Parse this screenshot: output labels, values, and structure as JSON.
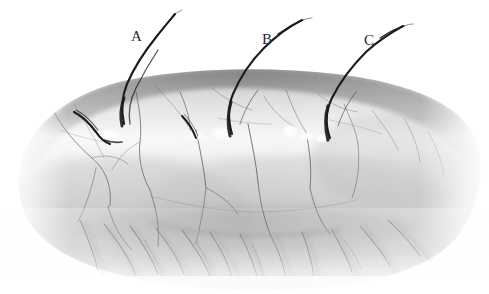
{
  "figure": {
    "domain": "scientific-illustration",
    "background_color": "#ffffff",
    "width": 489,
    "height": 294,
    "ink_color": "#1c1c1c",
    "skin_mid_tone": "#c9c9c9",
    "skin_light_tone": "#eaeaea",
    "skin_dark_tone": "#9a9a9a"
  },
  "labels": [
    {
      "id": "A",
      "text": "A",
      "x": 131,
      "y": 29,
      "leader_to_hair": "hair-a"
    },
    {
      "id": "B",
      "text": "B",
      "x": 262,
      "y": 32,
      "leader_to_hair": "hair-b"
    },
    {
      "id": "C",
      "text": "C",
      "x": 364,
      "y": 33,
      "leader_to_hair": "hair-c"
    }
  ],
  "hairs": [
    {
      "id": "hair-a",
      "label": "A",
      "emerges_at_x": 126,
      "emerges_at_y": 118,
      "tip_x": 174,
      "tip_y": 14,
      "description": "long dark S-curved hair, thick at base, tapering tip"
    },
    {
      "id": "hair-b",
      "label": "B",
      "emerges_at_x": 235,
      "emerges_at_y": 131,
      "tip_x": 301,
      "tip_y": 21,
      "description": "long dark S-curved hair emerging from skin with white highlight at base"
    },
    {
      "id": "hair-c",
      "label": "C",
      "emerges_at_x": 331,
      "emerges_at_y": 136,
      "tip_x": 402,
      "tip_y": 27,
      "description": "long dark S-curved hair emerging from skin on the right"
    }
  ],
  "hair_stubs": [
    {
      "id": "stub-left",
      "x": 80,
      "y": 115,
      "description": "short curved broken hair stub at left"
    },
    {
      "id": "stub-mid",
      "x": 186,
      "y": 122,
      "description": "short curved broken hair stub at center"
    }
  ],
  "highlights": [
    {
      "id": "highlight-b",
      "x": 222,
      "y": 133,
      "r": 7
    },
    {
      "id": "highlight-c1",
      "x": 290,
      "y": 131,
      "r": 6
    },
    {
      "id": "highlight-c2",
      "x": 306,
      "y": 135,
      "r": 5
    },
    {
      "id": "highlight-c3",
      "x": 320,
      "y": 137,
      "r": 5
    }
  ],
  "skin_surface": {
    "id": "skin-body",
    "top_arc_left_x": 22,
    "top_arc_peak_x": 230,
    "top_arc_peak_y": 76,
    "top_arc_right_x": 478,
    "bottom_fade_y": 285,
    "description": "arched skin slab, dark rim along top edge, lighter band beneath, soft fibrous fade at bottom"
  },
  "veins": {
    "count": 26,
    "color": "#4a4a4a",
    "description": "thin branching capillary lines descending across the skin"
  },
  "fibers": {
    "count": 22,
    "color": "#8e8e8e",
    "description": "feathery diagonal fiber strokes fading below the skin slab"
  }
}
